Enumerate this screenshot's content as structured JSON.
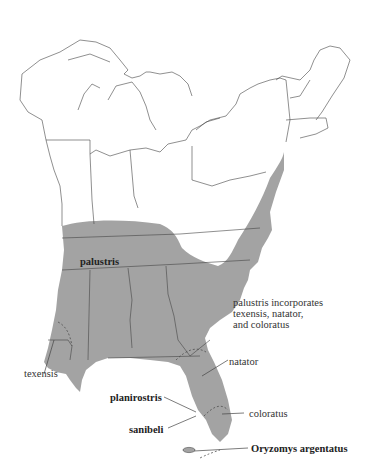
{
  "map": {
    "title": "Distribution of Oryzomys palustris subspecies",
    "colors": {
      "range_fill": "#a3a3a3",
      "state_line": "#444444",
      "background": "#ffffff"
    },
    "labels": {
      "palustris": "palustris",
      "incorporates_line1": "palustris incorporates",
      "incorporates_line2": "texensis, natator,",
      "incorporates_line3": "and coloratus",
      "texensis": "texensis",
      "natator": "natator",
      "planirostris": "planirostris",
      "sanibeli": "sanibeli",
      "coloratus": "coloratus",
      "argentatus": "Oryzomys argentatus"
    }
  }
}
